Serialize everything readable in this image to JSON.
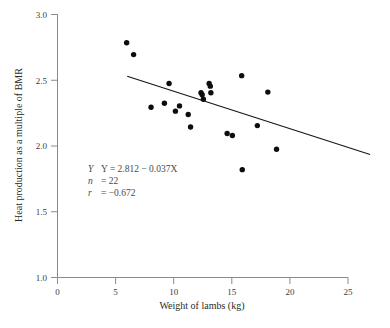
{
  "chart_data": {
    "type": "scatter",
    "title": "",
    "xlabel": "Weight of lambs (kg)",
    "ylabel": "Heat production as a multiple of BMR",
    "xlim": [
      0,
      25
    ],
    "ylim": [
      1.0,
      3.0
    ],
    "xticks": [
      0,
      5,
      10,
      15,
      20,
      25
    ],
    "xticklabels": [
      "0",
      "5",
      "10",
      "15",
      "20",
      "25"
    ],
    "yticks": [
      1.0,
      1.5,
      2.0,
      2.5,
      3.0
    ],
    "yticklabels": [
      "1.0",
      "1.5",
      "2.0",
      "2.5",
      "3.0"
    ],
    "grid": false,
    "legend": "none",
    "marker_color": "#0d0d0d",
    "line_color": "#161616",
    "axis_color": "#8a8a8a",
    "points": [
      {
        "x": 5.95,
        "y": 2.785
      },
      {
        "x": 6.55,
        "y": 2.695
      },
      {
        "x": 8.05,
        "y": 2.295
      },
      {
        "x": 9.2,
        "y": 2.325
      },
      {
        "x": 9.6,
        "y": 2.475
      },
      {
        "x": 10.15,
        "y": 2.265
      },
      {
        "x": 10.5,
        "y": 2.305
      },
      {
        "x": 11.25,
        "y": 2.24
      },
      {
        "x": 11.45,
        "y": 2.145
      },
      {
        "x": 12.35,
        "y": 2.405
      },
      {
        "x": 12.55,
        "y": 2.355
      },
      {
        "x": 13.05,
        "y": 2.475
      },
      {
        "x": 13.2,
        "y": 2.405
      },
      {
        "x": 14.6,
        "y": 2.095
      },
      {
        "x": 15.05,
        "y": 2.08
      },
      {
        "x": 15.85,
        "y": 2.535
      },
      {
        "x": 15.9,
        "y": 1.82
      },
      {
        "x": 17.2,
        "y": 2.155
      },
      {
        "x": 18.1,
        "y": 2.41
      },
      {
        "x": 18.85,
        "y": 1.975
      },
      {
        "x": 12.45,
        "y": 2.39
      },
      {
        "x": 13.15,
        "y": 2.455
      }
    ],
    "fit_line": {
      "equation": "Y = 2.812 − 0.037X",
      "intercept": 2.812,
      "slope": -0.037,
      "x_start": 6.0,
      "x_end": 26.9,
      "y_start": 2.53,
      "y_end": 1.935
    },
    "annotations": {
      "equation": "Y  =  2.812 − 0.037X",
      "n_label": "n",
      "n_value": "=  22",
      "r_label": "r",
      "r_value": "=  −0.672",
      "y_label": "Y"
    }
  }
}
